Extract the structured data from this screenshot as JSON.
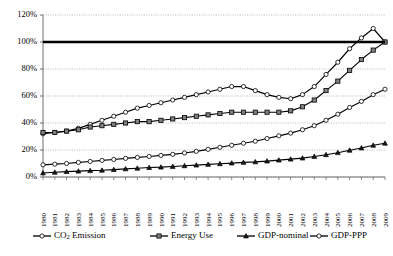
{
  "chart_data": {
    "type": "line",
    "title": "",
    "subtitle": "",
    "xlabel": "",
    "ylabel": "",
    "xlim": [
      1980,
      2009
    ],
    "ylim": [
      0,
      120
    ],
    "yticks": [
      "0%",
      "20%",
      "40%",
      "60%",
      "80%",
      "100%",
      "120%"
    ],
    "ytick_values": [
      0,
      20,
      40,
      60,
      80,
      100,
      120
    ],
    "grid": true,
    "grid_style": "dotted-horizontal",
    "legend_position": "bottom",
    "reference_line": {
      "value": 100,
      "label": "100%",
      "style": "thick-solid-black"
    },
    "categories": [
      "1980",
      "1981",
      "1982",
      "1983",
      "1984",
      "1985",
      "1986",
      "1987",
      "1988",
      "1989",
      "1990",
      "1991",
      "1992",
      "1993",
      "1994",
      "1995",
      "1996",
      "1997",
      "1998",
      "1999",
      "2000",
      "2001",
      "2002",
      "2003",
      "2004",
      "2005",
      "2006",
      "2007",
      "2008",
      "2009"
    ],
    "series": [
      {
        "name": "CO2 Emission",
        "label_main": "CO",
        "label_sub": "2",
        "label_tail": " Emission",
        "marker": "open-circle",
        "color": "#000000",
        "marker_fill": "#ffffff",
        "values": [
          32,
          33,
          34,
          36,
          39,
          42,
          45,
          48,
          51,
          53,
          55,
          57,
          59,
          61,
          63,
          65,
          67,
          67,
          64,
          61,
          59,
          58,
          61,
          67,
          76,
          85,
          95,
          103,
          110,
          100
        ]
      },
      {
        "name": "Energy Use",
        "label_main": "Energy Use",
        "label_sub": "",
        "label_tail": "",
        "marker": "filled-square",
        "color": "#000000",
        "marker_fill": "#808080",
        "values": [
          33,
          33,
          34,
          35,
          37,
          38,
          39,
          40,
          41,
          41,
          42,
          43,
          44,
          45,
          46,
          47,
          48,
          48,
          48,
          48,
          48,
          49,
          52,
          57,
          64,
          71,
          79,
          87,
          94,
          100
        ]
      },
      {
        "name": "GDP-nominal",
        "label_main": "GDP-nominal",
        "label_sub": "",
        "label_tail": "",
        "marker": "filled-triangle",
        "color": "#000000",
        "marker_fill": "#1a1a1a",
        "values": [
          3,
          3.5,
          4,
          4.3,
          4.7,
          5,
          5.5,
          6,
          6.5,
          7,
          7.3,
          7.8,
          8.3,
          8.8,
          9.3,
          9.8,
          10.3,
          10.8,
          11.2,
          11.8,
          12.5,
          13.2,
          14,
          15.2,
          16.5,
          18,
          19.8,
          21.5,
          23.5,
          25
        ]
      },
      {
        "name": "GDP-PPP",
        "label_main": "GDP-PPP",
        "label_sub": "",
        "label_tail": "",
        "marker": "open-circle",
        "color": "#000000",
        "marker_fill": "#ffffff",
        "values": [
          9,
          9.5,
          10,
          10.8,
          11.5,
          12.3,
          13,
          13.8,
          14.5,
          15.2,
          16,
          16.8,
          17.8,
          19,
          20.5,
          22,
          23.5,
          25,
          26.5,
          28.5,
          30.5,
          32.5,
          35,
          38,
          42,
          46.5,
          51.5,
          56,
          61,
          65
        ]
      }
    ]
  }
}
